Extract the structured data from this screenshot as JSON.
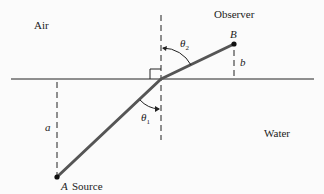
{
  "diagram": {
    "media": {
      "upper": "Air",
      "lower": "Water"
    },
    "points": {
      "A": {
        "letter": "A",
        "role": "Source"
      },
      "B": {
        "letter": "B",
        "role": "Observer"
      }
    },
    "distances": {
      "a": "a",
      "b": "b"
    },
    "angles": {
      "theta1": "θ",
      "theta1_sub": "1",
      "theta2": "θ",
      "theta2_sub": "2"
    },
    "colors": {
      "ray": "#555555",
      "line": "#222222",
      "background": "#fbfbfb"
    }
  }
}
